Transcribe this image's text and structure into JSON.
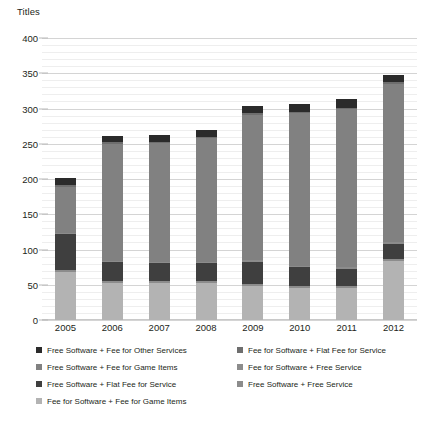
{
  "chart_data": {
    "type": "bar",
    "subtype": "stacked-bar",
    "title": "",
    "ylabel": "Titles",
    "xlabel": "",
    "ylim": [
      0,
      400
    ],
    "ytick_values": [
      0,
      50,
      100,
      150,
      200,
      250,
      300,
      350,
      400
    ],
    "ytick_labels": [
      "0",
      "50",
      "100",
      "150",
      "200",
      "250",
      "300",
      "350",
      "400"
    ],
    "minor_tick_step": 10,
    "grid": true,
    "legend_position": "bottom",
    "categories": [
      "2005",
      "2006",
      "2007",
      "2008",
      "2009",
      "2010",
      "2011",
      "2012"
    ],
    "series": [
      {
        "name": "Fee for Software + Fee for Game Items",
        "color": "#b3b3b3",
        "values": [
          68,
          52,
          52,
          53,
          48,
          45,
          45,
          84
        ]
      },
      {
        "name": "Free Software + Free Service",
        "color": "#8c8c8c",
        "values": [
          3,
          3,
          3,
          3,
          3,
          3,
          3,
          3
        ]
      },
      {
        "name": "Free Software + Flat Fee for Service",
        "color": "#3f3f3f",
        "values": [
          51,
          27,
          26,
          25,
          32,
          27,
          25,
          21
        ]
      },
      {
        "name": "Fee for Software + Free Service",
        "color": "#8c8c8c",
        "values": [
          2,
          2,
          2,
          2,
          2,
          2,
          2,
          2
        ]
      },
      {
        "name": "Free Software + Fee for Game Items",
        "color": "#818181",
        "values": [
          65,
          166,
          168,
          175,
          206,
          216,
          224,
          225
        ]
      },
      {
        "name": "Fee for Software + Flat Fee for Service",
        "color": "#6e6e6e",
        "values": [
          2,
          2,
          2,
          2,
          2,
          2,
          2,
          2
        ]
      },
      {
        "name": "Free Software + Fee for Other Services",
        "color": "#2b2b2b",
        "values": [
          10,
          9,
          9,
          10,
          11,
          12,
          12,
          11
        ]
      }
    ],
    "totals": [
      201,
      261,
      262,
      270,
      304,
      307,
      313,
      348
    ]
  },
  "legend": {
    "items": [
      {
        "label": "Free Software + Fee for Other Services",
        "color": "#2b2b2b",
        "column": 0,
        "row": 0
      },
      {
        "label": "Free Software + Fee for Game Items",
        "color": "#818181",
        "column": 0,
        "row": 1
      },
      {
        "label": "Free Software + Flat Fee for Service",
        "color": "#3f3f3f",
        "column": 0,
        "row": 2
      },
      {
        "label": "Fee for Software + Fee for Game Items",
        "color": "#b3b3b3",
        "column": 0,
        "row": 3
      },
      {
        "label": "Fee for Software + Flat Fee for Service",
        "color": "#6e6e6e",
        "column": 1,
        "row": 0
      },
      {
        "label": "Fee for Software + Free Service",
        "color": "#8c8c8c",
        "column": 1,
        "row": 1
      },
      {
        "label": "Free Software + Free Service",
        "color": "#8c8c8c",
        "column": 1,
        "row": 2
      }
    ]
  }
}
